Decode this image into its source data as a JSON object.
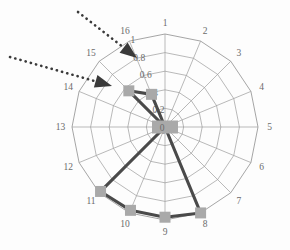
{
  "chart_data": {
    "type": "line",
    "subtype": "polar-radar",
    "title": "",
    "subtitle": "",
    "xlabel": "",
    "ylabel": "",
    "categories": [
      "1",
      "2",
      "3",
      "4",
      "5",
      "6",
      "7",
      "8",
      "9",
      "10",
      "11",
      "12",
      "13",
      "14",
      "15",
      "16"
    ],
    "angular_labels": [
      "1",
      "2",
      "3",
      "4",
      "5",
      "6",
      "7",
      "8",
      "9",
      "10",
      "11",
      "12",
      "13",
      "14",
      "15",
      "16"
    ],
    "angular_start_deg": 0,
    "angular_direction": "clockwise",
    "radial_ticks": [
      "0",
      "0.2",
      "0.4",
      "0.6",
      "0.8",
      "1"
    ],
    "radial_tick_values": [
      0,
      0.2,
      0.4,
      0.6,
      0.8,
      1
    ],
    "rlim": [
      0,
      1
    ],
    "grid": true,
    "legend": "none",
    "series": [
      {
        "name": "series-1",
        "color": "#4a4a4a",
        "marker": "square",
        "marker_color": "#a9a9a9",
        "values": [
          0,
          0,
          0,
          0,
          0,
          0,
          0,
          1.0,
          0.97,
          0.97,
          0.98,
          0,
          0,
          0,
          0.55,
          0.38
        ]
      }
    ],
    "annotations": [
      {
        "name": "arrow-upper",
        "style": "dotted-line-with-arrowhead",
        "from": {
          "x": 78,
          "y": 12
        },
        "to": {
          "x": 137,
          "y": 58
        },
        "color": "#3a3a3a",
        "target_label": "16"
      },
      {
        "name": "arrow-lower",
        "style": "dotted-line-with-arrowhead",
        "from": {
          "x": 10,
          "y": 57
        },
        "to": {
          "x": 112,
          "y": 86
        },
        "color": "#3a3a3a",
        "target_label": "15"
      }
    ]
  },
  "geometry": {
    "cx": 165,
    "cy": 127,
    "radius": 93
  },
  "colors": {
    "grid": "#9b9b9b",
    "series_line": "#4a4a4a",
    "marker_fill": "#a9a9a9",
    "text": "#6b6b6b",
    "annotation": "#3a3a3a",
    "background": "#fdfdfd"
  }
}
